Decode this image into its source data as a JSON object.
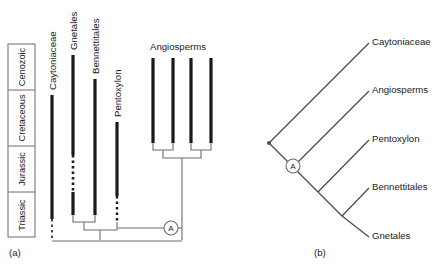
{
  "figure": {
    "background_color": "#ffffff",
    "line_color": "#4d4d4d",
    "bar_color": "#1a1a1a",
    "text_color": "#1a1a1a"
  },
  "panel_a": {
    "caption": "(a)",
    "timescale": {
      "name": "geologic-time-column",
      "periods": [
        {
          "label": "Cenozoic",
          "top": 44,
          "bottom": 90
        },
        {
          "label": "Cretaceous",
          "top": 90,
          "bottom": 146
        },
        {
          "label": "Jurassic",
          "top": 146,
          "bottom": 192
        },
        {
          "label": "Triassic",
          "top": 192,
          "bottom": 237
        }
      ]
    },
    "taxa": [
      {
        "label": "Caytoniaceae",
        "x": 52,
        "bar_top": 95,
        "bar_bottom": 219,
        "dashed_top": 219,
        "dashed_bottom": 240
      },
      {
        "label": "Gnetales",
        "x": 73,
        "bar_top": 55,
        "bar_bottom": 155,
        "gap_top": 155,
        "gap_bottom": 192,
        "bar2_top": 192,
        "bar2_bottom": 215
      },
      {
        "label": "Bennettitales",
        "x": 95,
        "bar_top": 79,
        "bar_bottom": 215
      },
      {
        "label": "Pentoxylon",
        "x": 117,
        "bar_top": 122,
        "bar_bottom": 196,
        "dashed_top": 196,
        "dashed_bottom": 221
      },
      {
        "label": "Angiosperms",
        "x": 153,
        "bar_top": 58,
        "bar_bottom": 143
      },
      {
        "label": "",
        "x": 173,
        "bar_top": 58,
        "bar_bottom": 143
      },
      {
        "label": "",
        "x": 191,
        "bar_top": 58,
        "bar_bottom": 143
      },
      {
        "label": "",
        "x": 211,
        "bar_top": 58,
        "bar_bottom": 143
      }
    ],
    "node_label": "A",
    "node_position": {
      "x": 171,
      "y": 228
    }
  },
  "panel_b": {
    "caption": "(b)",
    "node_label": "A",
    "tips": [
      {
        "label": "Caytoniaceae",
        "x": 372,
        "y": 42
      },
      {
        "label": "Angiosperms",
        "x": 372,
        "y": 90
      },
      {
        "label": "Pentoxylon",
        "x": 372,
        "y": 139
      },
      {
        "label": "Bennettitales",
        "x": 372,
        "y": 187
      },
      {
        "label": "Gnetales",
        "x": 372,
        "y": 235
      }
    ]
  }
}
